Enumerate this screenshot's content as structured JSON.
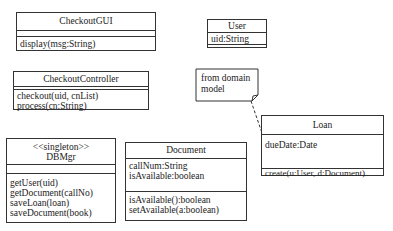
{
  "diagram": {
    "type": "UML class diagram",
    "classes": [
      {
        "name": "CheckoutGUI",
        "stereotype": "",
        "attributes": [],
        "operations": [
          "display(msg:String)"
        ]
      },
      {
        "name": "User",
        "stereotype": "",
        "attributes": [
          "uid:String"
        ],
        "operations": []
      },
      {
        "name": "CheckoutController",
        "stereotype": "",
        "attributes": [],
        "operations": [
          "checkout(uid, cnList)",
          "process(cn:String)"
        ]
      },
      {
        "name": "DBMgr",
        "stereotype": "<<singleton>>",
        "attributes": [],
        "operations": [
          "getUser(uid)",
          "getDocument(callNo)",
          "saveLoan(loan)",
          "saveDocument(book)"
        ]
      },
      {
        "name": "Document",
        "stereotype": "",
        "attributes": [
          "callNum:String",
          "isAvailable:boolean"
        ],
        "operations": [
          "isAvailable():boolean",
          "setAvailable(a:boolean)"
        ]
      },
      {
        "name": "Loan",
        "stereotype": "",
        "attributes": [
          "dueDate:Date"
        ],
        "operations": [
          "create(u:User, d:Document)"
        ]
      }
    ],
    "note": {
      "lines": [
        "from domain",
        "model"
      ],
      "attached_to": "Loan"
    }
  }
}
